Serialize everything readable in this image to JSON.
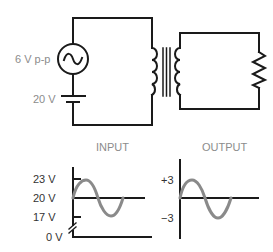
{
  "circuit": {
    "source_label": "6 V p-p",
    "battery_label": "20 V",
    "components": [
      "ac-source",
      "battery",
      "transformer",
      "resistor"
    ]
  },
  "graphs": {
    "input": {
      "title": "INPUT",
      "ticks": [
        "23 V",
        "20 V",
        "17 V",
        "0 V"
      ]
    },
    "output": {
      "title": "OUTPUT",
      "ticks": [
        "+3",
        "−3"
      ]
    }
  },
  "colors": {
    "wire": "#1a1a1a",
    "wave": "#8a8a8a",
    "label": "#8c8c8c"
  }
}
